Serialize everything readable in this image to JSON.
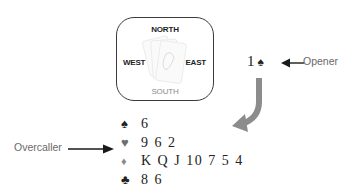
{
  "table": {
    "north": "NORTH",
    "south": "SOUTH",
    "west": "WEST",
    "east": "EAST",
    "center_icon": "playing-cards-icon"
  },
  "opening_bid": {
    "level": "1",
    "suit": "♠",
    "label": "Opener"
  },
  "overcaller": {
    "label": "Overcaller",
    "hand": [
      {
        "suit": "♠",
        "suit_name": "spades",
        "cards": "6"
      },
      {
        "suit": "♥",
        "suit_name": "hearts",
        "cards": "9 6 2"
      },
      {
        "suit": "♦",
        "suit_name": "diamonds",
        "cards": "K Q J 10 7 5 4"
      },
      {
        "suit": "♣",
        "suit_name": "clubs",
        "cards": "8 6"
      }
    ]
  },
  "colors": {
    "text_dark": "#222222",
    "label_gray": "#6a6a6a",
    "curved_arrow": "#8c8c8c",
    "south_gray": "#8a8a8a"
  }
}
